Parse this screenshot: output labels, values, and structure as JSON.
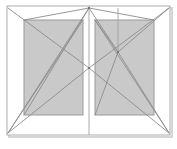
{
  "diagram": {
    "type": "architectural-elevation",
    "canvas": {
      "width": 177,
      "height": 149
    },
    "colors": {
      "background": "#ffffff",
      "panel_fill": "#c9c9c9",
      "panel_stroke": "#9a9a9a",
      "frame_stroke": "#b4b4b4",
      "diagonal_stroke": "#8c8c8c",
      "mullion_stroke": "#a0a0a0",
      "shadow": "#d6d6d6"
    },
    "stroke_widths": {
      "frame": 1.1,
      "panel": 1.0,
      "diagonal": 0.9,
      "mullion": 0.9
    },
    "outer_frame": {
      "label": "outer-frame",
      "x": 7,
      "y": 6,
      "width": 163,
      "height": 129
    },
    "panels": [
      {
        "label": "left-panel",
        "x": 24,
        "y": 20,
        "width": 59,
        "height": 95
      },
      {
        "label": "right-panel",
        "x": 95,
        "y": 20,
        "width": 59,
        "height": 95
      }
    ],
    "mullions": [
      {
        "label": "center-mullion",
        "x1": 89,
        "y1": 6,
        "x2": 89,
        "y2": 135
      },
      {
        "label": "right-inner-vertical",
        "x1": 118,
        "y1": 8,
        "x2": 118,
        "y2": 52
      }
    ],
    "diagonals": [
      {
        "label": "left-swing-upper",
        "x1": 8,
        "y1": 8,
        "x2": 89,
        "y2": 68
      },
      {
        "label": "left-swing-lower",
        "x1": 8,
        "y1": 133,
        "x2": 89,
        "y2": 68
      },
      {
        "label": "left-apex-upper",
        "x1": 24,
        "y1": 20,
        "x2": 89,
        "y2": 8
      },
      {
        "label": "left-apex-lower",
        "x1": 8,
        "y1": 133,
        "x2": 89,
        "y2": 8
      },
      {
        "label": "left-cross-down",
        "x1": 89,
        "y1": 8,
        "x2": 24,
        "y2": 115
      },
      {
        "label": "left-base-fan",
        "x1": 8,
        "y1": 133,
        "x2": 83,
        "y2": 20
      },
      {
        "label": "right-swing-upper",
        "x1": 169,
        "y1": 8,
        "x2": 89,
        "y2": 68
      },
      {
        "label": "right-swing-lower",
        "x1": 169,
        "y1": 133,
        "x2": 89,
        "y2": 68
      },
      {
        "label": "right-apex-upper",
        "x1": 89,
        "y1": 8,
        "x2": 154,
        "y2": 20
      },
      {
        "label": "right-node-a",
        "x1": 89,
        "y1": 8,
        "x2": 118,
        "y2": 52
      },
      {
        "label": "right-node-b",
        "x1": 95,
        "y1": 20,
        "x2": 118,
        "y2": 52
      },
      {
        "label": "right-node-c",
        "x1": 118,
        "y1": 52,
        "x2": 169,
        "y2": 8
      },
      {
        "label": "right-node-d",
        "x1": 118,
        "y1": 52,
        "x2": 169,
        "y2": 133
      },
      {
        "label": "right-node-e",
        "x1": 118,
        "y1": 52,
        "x2": 95,
        "y2": 115
      },
      {
        "label": "right-base-fan",
        "x1": 169,
        "y1": 133,
        "x2": 95,
        "y2": 20
      }
    ],
    "nodes": [
      {
        "label": "apex-node",
        "x": 89,
        "y": 8
      },
      {
        "label": "center-cross-node",
        "x": 89,
        "y": 68
      },
      {
        "label": "right-hub-node",
        "x": 118,
        "y": 52
      },
      {
        "label": "left-corner-node",
        "x": 8,
        "y": 133
      },
      {
        "label": "right-corner-node",
        "x": 169,
        "y": 133
      }
    ]
  }
}
